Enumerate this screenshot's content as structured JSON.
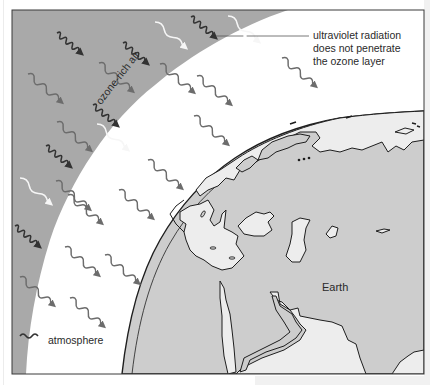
{
  "diagram": {
    "labels": {
      "uv_line1": "ultraviolet radiation",
      "uv_line2": "does not penetrate",
      "uv_line3": "the ozone layer",
      "ozone_band": "ozone-rich air",
      "atmosphere": "atmosphere",
      "earth": "Earth"
    },
    "regions": [
      {
        "name": "ozone-rich air band",
        "color": "#a9a9a9"
      },
      {
        "name": "atmosphere",
        "color": "#ffffff"
      },
      {
        "name": "earth land",
        "color": "#cdcdcd"
      },
      {
        "name": "earth sea",
        "color": "#ededed"
      }
    ],
    "wave_types": [
      {
        "name": "short-wavelength ultraviolet",
        "color": "#3a3a3a",
        "stops_at": "ozone layer"
      },
      {
        "name": "medium-wavelength radiation",
        "color": "#707070",
        "stops_at": "none"
      },
      {
        "name": "long-wavelength radiation",
        "color": "#f4f4f4",
        "stops_at": "ozone layer inner edge"
      }
    ]
  }
}
